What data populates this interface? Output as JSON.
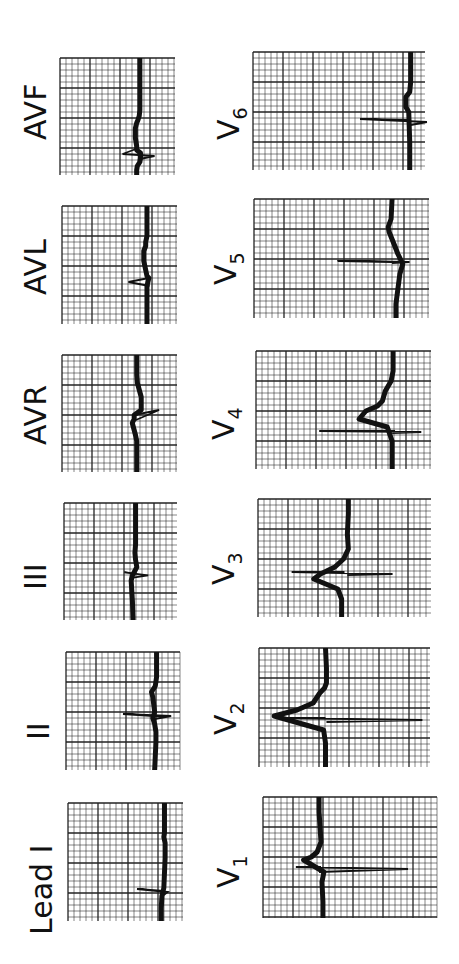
{
  "figure": {
    "orientation": "rotated 90 degrees counter-clockwise",
    "colors": {
      "background": "#ffffff",
      "ink": "#111111",
      "grid": "#222222"
    }
  },
  "limb_leads": [
    {
      "id": "avf",
      "label": "AVF",
      "x": 60,
      "y": 58,
      "w": 115,
      "h": 117,
      "baseline": 125,
      "trace": [
        [
          0,
          125
        ],
        [
          52,
          125
        ],
        [
          58,
          124
        ],
        [
          62,
          122
        ],
        [
          65,
          120
        ],
        [
          70,
          118
        ],
        [
          80,
          118
        ],
        [
          88,
          120
        ],
        [
          92,
          120
        ],
        [
          95,
          126
        ],
        [
          100,
          126
        ],
        [
          104,
          125
        ],
        [
          108,
          121
        ],
        [
          112,
          120
        ],
        [
          117,
          120
        ]
      ],
      "qrs": [
        [
          90,
          123
        ],
        [
          96,
          98
        ],
        [
          98,
          148
        ],
        [
          101,
          125
        ]
      ],
      "label_x": 22,
      "label_y": 140
    },
    {
      "id": "avl",
      "label": "AVL",
      "x": 62,
      "y": 206,
      "w": 115,
      "h": 118,
      "baseline": 133,
      "trace": [
        [
          0,
          133
        ],
        [
          30,
          133
        ],
        [
          36,
          131
        ],
        [
          40,
          131
        ],
        [
          45,
          128
        ],
        [
          55,
          128
        ],
        [
          70,
          133
        ],
        [
          72,
          136
        ],
        [
          80,
          133
        ],
        [
          118,
          133
        ]
      ],
      "qrs": [
        [
          72,
          136
        ],
        [
          76,
          104
        ],
        [
          80,
          137
        ]
      ],
      "label_x": 22,
      "label_y": 295
    },
    {
      "id": "avr",
      "label": "AVR",
      "x": 62,
      "y": 355,
      "w": 115,
      "h": 117,
      "baseline": 118,
      "trace": [
        [
          0,
          117
        ],
        [
          20,
          117
        ],
        [
          28,
          118
        ],
        [
          35,
          121
        ],
        [
          42,
          124
        ],
        [
          55,
          124
        ],
        [
          60,
          113
        ],
        [
          64,
          113
        ],
        [
          68,
          110
        ],
        [
          80,
          115
        ],
        [
          86,
          117
        ],
        [
          117,
          117
        ]
      ],
      "qrs": [
        [
          60,
          113
        ],
        [
          55,
          152
        ],
        [
          66,
          112
        ]
      ],
      "label_x": 22,
      "label_y": 445
    },
    {
      "id": "iii",
      "label": "III",
      "x": 64,
      "y": 503,
      "w": 113,
      "h": 117,
      "baseline": 114,
      "trace": [
        [
          0,
          114
        ],
        [
          40,
          114
        ],
        [
          48,
          113
        ],
        [
          55,
          114
        ],
        [
          62,
          116
        ],
        [
          70,
          109
        ],
        [
          75,
          107
        ],
        [
          85,
          108
        ],
        [
          95,
          109
        ],
        [
          113,
          110
        ]
      ],
      "qrs": [
        [
          68,
          112
        ],
        [
          67,
          96
        ],
        [
          70,
          134
        ],
        [
          72,
          110
        ]
      ],
      "label_x": 22,
      "label_y": 590
    },
    {
      "id": "ii",
      "label": "II",
      "x": 66,
      "y": 652,
      "w": 114,
      "h": 118,
      "baseline": 142,
      "trace": [
        [
          0,
          143
        ],
        [
          25,
          143
        ],
        [
          34,
          141
        ],
        [
          40,
          135
        ],
        [
          45,
          137
        ],
        [
          60,
          140
        ],
        [
          66,
          137
        ],
        [
          72,
          140
        ],
        [
          80,
          142
        ],
        [
          90,
          142
        ],
        [
          118,
          140
        ]
      ],
      "qrs": [
        [
          64,
          138
        ],
        [
          62,
          90
        ],
        [
          64,
          166
        ],
        [
          67,
          140
        ]
      ],
      "label_x": 25,
      "label_y": 740
    },
    {
      "id": "i",
      "label": "Lead I",
      "x": 68,
      "y": 803,
      "w": 115,
      "h": 118,
      "baseline": 151,
      "trace": [
        [
          0,
          151
        ],
        [
          30,
          151
        ],
        [
          34,
          150
        ],
        [
          40,
          152
        ],
        [
          55,
          152
        ],
        [
          85,
          150
        ],
        [
          93,
          147
        ],
        [
          105,
          146
        ],
        [
          118,
          146
        ]
      ],
      "qrs": [
        [
          88,
          150
        ],
        [
          86,
          108
        ],
        [
          89,
          156
        ],
        [
          92,
          150
        ]
      ],
      "label_x": 28,
      "label_y": 935
    }
  ],
  "chest_leads": [
    {
      "id": "v6",
      "label": "V",
      "sub": "6",
      "x": 253,
      "y": 52,
      "w": 172,
      "h": 118,
      "baseline": 165,
      "trace": [
        [
          0,
          165
        ],
        [
          30,
          165
        ],
        [
          40,
          164
        ],
        [
          45,
          160
        ],
        [
          55,
          160
        ],
        [
          60,
          163
        ],
        [
          90,
          164
        ],
        [
          105,
          164
        ],
        [
          118,
          164
        ]
      ],
      "qrs": [
        [
          68,
          164
        ],
        [
          67,
          112
        ],
        [
          70,
          182
        ],
        [
          73,
          165
        ]
      ],
      "label_x": 215,
      "label_y": 140
    },
    {
      "id": "v5",
      "label": "V",
      "sub": "5",
      "x": 254,
      "y": 199,
      "w": 175,
      "h": 119,
      "baseline": 142,
      "trace": [
        [
          0,
          142
        ],
        [
          20,
          141
        ],
        [
          28,
          138
        ],
        [
          33,
          139
        ],
        [
          45,
          144
        ],
        [
          55,
          148
        ],
        [
          65,
          153
        ],
        [
          75,
          150
        ],
        [
          90,
          148
        ],
        [
          105,
          146
        ],
        [
          119,
          146
        ]
      ],
      "qrs": [
        [
          63,
          142
        ],
        [
          62,
          86
        ],
        [
          63,
          160
        ],
        [
          64,
          142
        ]
      ],
      "label_x": 212,
      "label_y": 285
    },
    {
      "id": "v4",
      "label": "V",
      "sub": "4",
      "x": 256,
      "y": 351,
      "w": 175,
      "h": 118,
      "baseline": 141,
      "trace": [
        [
          0,
          141
        ],
        [
          10,
          141
        ],
        [
          20,
          141
        ],
        [
          30,
          139
        ],
        [
          40,
          133
        ],
        [
          50,
          130
        ],
        [
          55,
          125
        ],
        [
          60,
          113
        ],
        [
          68,
          106
        ],
        [
          76,
          135
        ],
        [
          90,
          140
        ],
        [
          105,
          140
        ],
        [
          118,
          140
        ]
      ],
      "qrs": [
        [
          80,
          143
        ],
        [
          80,
          65
        ],
        [
          81,
          170
        ],
        [
          82,
          140
        ]
      ],
      "label_x": 210,
      "label_y": 440
    },
    {
      "id": "v3",
      "label": "V",
      "sub": "3",
      "x": 258,
      "y": 499,
      "w": 173,
      "h": 118,
      "baseline": 94,
      "trace": [
        [
          0,
          94
        ],
        [
          15,
          94
        ],
        [
          35,
          93
        ],
        [
          50,
          94
        ],
        [
          60,
          89
        ],
        [
          68,
          80
        ],
        [
          75,
          65
        ],
        [
          80,
          58
        ],
        [
          90,
          83
        ],
        [
          100,
          87
        ],
        [
          118,
          87
        ]
      ],
      "qrs": [
        [
          73,
          90
        ],
        [
          73,
          35
        ],
        [
          75,
          140
        ],
        [
          76,
          93
        ]
      ],
      "label_x": 210,
      "label_y": 585
    },
    {
      "id": "v2",
      "label": "V",
      "sub": "2",
      "x": 259,
      "y": 648,
      "w": 171,
      "h": 119,
      "baseline": 70,
      "trace": [
        [
          0,
          70
        ],
        [
          20,
          71
        ],
        [
          35,
          71
        ],
        [
          40,
          69
        ],
        [
          45,
          64
        ],
        [
          55,
          57
        ],
        [
          62,
          40
        ],
        [
          68,
          16
        ],
        [
          82,
          68
        ],
        [
          95,
          70
        ],
        [
          119,
          70
        ]
      ],
      "qrs": [
        [
          70,
          70
        ],
        [
          70,
          20
        ],
        [
          72,
          172
        ],
        [
          74,
          71
        ]
      ],
      "label_x": 212,
      "label_y": 735
    },
    {
      "id": "v1",
      "label": "V",
      "sub": "1",
      "x": 263,
      "y": 797,
      "w": 174,
      "h": 121,
      "baseline": 58,
      "trace": [
        [
          0,
          58
        ],
        [
          15,
          58
        ],
        [
          30,
          59
        ],
        [
          45,
          60
        ],
        [
          55,
          56
        ],
        [
          60,
          50
        ],
        [
          63,
          42
        ],
        [
          75,
          63
        ],
        [
          85,
          61
        ],
        [
          105,
          62
        ],
        [
          121,
          62
        ]
      ],
      "qrs": [
        [
          70,
          60
        ],
        [
          70,
          34
        ],
        [
          72,
          150
        ],
        [
          75,
          58
        ]
      ],
      "label_x": 215,
      "label_y": 888
    }
  ],
  "grid": {
    "small_square_px": 6,
    "major_every": 5
  }
}
